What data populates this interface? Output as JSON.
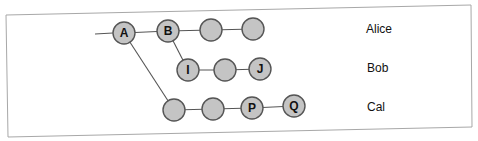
{
  "diagram": {
    "type": "commit-graph",
    "colors": {
      "node_fill": "#c4c4c4",
      "node_stroke": "#555555",
      "edge": "#555555",
      "frame": "#a8a8a8"
    },
    "rows": [
      {
        "id": "alice",
        "label": "Alice"
      },
      {
        "id": "bob",
        "label": "Bob"
      },
      {
        "id": "cal",
        "label": "Cal"
      }
    ],
    "nodes": [
      {
        "id": "A",
        "label": "A",
        "row": "alice"
      },
      {
        "id": "B",
        "label": "B",
        "row": "alice"
      },
      {
        "id": "alice3",
        "label": "",
        "row": "alice"
      },
      {
        "id": "alice4",
        "label": "",
        "row": "alice"
      },
      {
        "id": "I",
        "label": "I",
        "row": "bob"
      },
      {
        "id": "bob2",
        "label": "",
        "row": "bob"
      },
      {
        "id": "J",
        "label": "J",
        "row": "bob"
      },
      {
        "id": "cal1",
        "label": "",
        "row": "cal"
      },
      {
        "id": "cal2",
        "label": "",
        "row": "cal"
      },
      {
        "id": "P",
        "label": "P",
        "row": "cal"
      },
      {
        "id": "Q",
        "label": "Q",
        "row": "cal"
      }
    ],
    "edges": [
      [
        "start",
        "A"
      ],
      [
        "A",
        "B"
      ],
      [
        "B",
        "alice3"
      ],
      [
        "alice3",
        "alice4"
      ],
      [
        "B",
        "I"
      ],
      [
        "I",
        "bob2"
      ],
      [
        "bob2",
        "J"
      ],
      [
        "A",
        "cal1"
      ],
      [
        "cal1",
        "cal2"
      ],
      [
        "cal2",
        "P"
      ],
      [
        "P",
        "Q"
      ]
    ]
  }
}
